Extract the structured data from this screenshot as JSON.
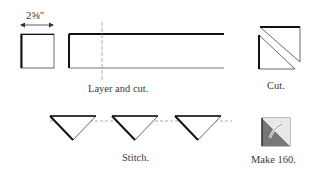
{
  "diagram": {
    "dimension_label": "2⅝\"",
    "step1_label": "Layer and cut.",
    "step2_label": "Cut.",
    "step3_label": "Stitch.",
    "step4_label": "Make 160.",
    "colors": {
      "line": "#1a1a1a",
      "dashed": "#999999",
      "shade": "#777777",
      "light_shade": "#cccccc"
    }
  }
}
